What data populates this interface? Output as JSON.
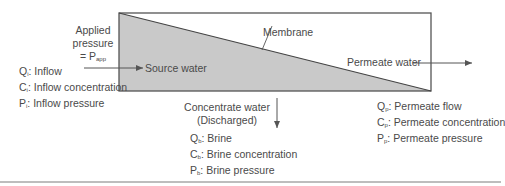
{
  "diagram": {
    "colors": {
      "stroke": "#555555",
      "feed_fill": "#c9c9c9",
      "text": "#4a4a4a",
      "bottom_rule": "#bdbdbd"
    },
    "applied_pressure": {
      "line1": "Applied",
      "line2": "pressure",
      "eq": "= P",
      "sub": "app"
    },
    "inflow": {
      "items": [
        {
          "symbol": "Q",
          "sub": "i",
          "label": ": Inflow"
        },
        {
          "symbol": "C",
          "sub": "i",
          "label": ": Inflow concentration"
        },
        {
          "symbol": "P",
          "sub": "i",
          "label": ": Inflow pressure"
        }
      ]
    },
    "source_water": "Source water",
    "membrane": "Membrane",
    "permeate_water": "Permeate water",
    "concentrate": {
      "line1": "Concentrate water",
      "line2": "(Discharged)"
    },
    "brine": {
      "items": [
        {
          "symbol": "Q",
          "sub": "b",
          "label": ": Brine"
        },
        {
          "symbol": "C",
          "sub": "b",
          "label": ": Brine concentration"
        },
        {
          "symbol": "P",
          "sub": "b",
          "label": ": Brine pressure"
        }
      ]
    },
    "permeate": {
      "items": [
        {
          "symbol": "Q",
          "sub": "p",
          "label": ": Permeate flow"
        },
        {
          "symbol": "C",
          "sub": "p",
          "label": ": Permeate concentration"
        },
        {
          "symbol": "P",
          "sub": "p",
          "label": ": Permeate pressure"
        }
      ]
    }
  }
}
